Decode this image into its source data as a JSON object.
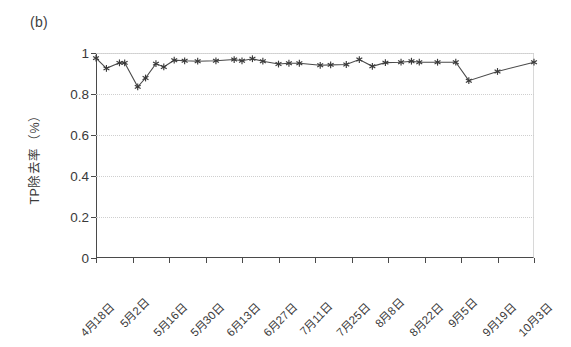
{
  "panel": {
    "label": "(b)"
  },
  "axes": {
    "ylabel": "TP除去率（%）",
    "ytick_labels": [
      "1",
      "0.8",
      "0.6",
      "0.4",
      "0.2",
      "0"
    ],
    "xtick_labels": [
      "4月18日",
      "5月2日",
      "5月16日",
      "5月30日",
      "6月13日",
      "6月27日",
      "7月11日",
      "7月25日",
      "8月8日",
      "8月22日",
      "9月5日",
      "9月19日",
      "10月3日"
    ]
  },
  "style": {
    "line_color": "#4a4a4a",
    "marker_color": "#3a3a3a",
    "grid_color": "#cfcfcf",
    "axis_color": "#4a4a4a",
    "background": "#ffffff"
  },
  "chart_data": {
    "type": "line",
    "title": "(b)",
    "xlabel": "",
    "ylabel": "TP除去率（%）",
    "ylim": [
      0,
      1
    ],
    "yticks": [
      0,
      0.2,
      0.4,
      0.6,
      0.8,
      1
    ],
    "grid": true,
    "legend": "none",
    "marker": "asterisk",
    "xtick_labels": [
      "4月18日",
      "5月2日",
      "5月16日",
      "5月30日",
      "6月13日",
      "6月27日",
      "7月11日",
      "7月25日",
      "8月8日",
      "8月22日",
      "9月5日",
      "9月19日",
      "10月3日"
    ],
    "xtick_positions": [
      0,
      14,
      28,
      42,
      56,
      70,
      84,
      98,
      112,
      126,
      140,
      154,
      168
    ],
    "xlim": [
      0,
      168
    ],
    "x_unit": "days since 4月18日",
    "series": [
      {
        "name": "TP除去率",
        "x": [
          0,
          4,
          9,
          11,
          16,
          19,
          23,
          26,
          30,
          34,
          39,
          46,
          53,
          56,
          60,
          64,
          70,
          74,
          78,
          86,
          90,
          96,
          101,
          106,
          111,
          117,
          121,
          124,
          131,
          138,
          143,
          154,
          168
        ],
        "values": [
          0.975,
          0.925,
          0.952,
          0.952,
          0.835,
          0.878,
          0.948,
          0.932,
          0.965,
          0.962,
          0.96,
          0.962,
          0.968,
          0.962,
          0.972,
          0.96,
          0.946,
          0.95,
          0.95,
          0.94,
          0.942,
          0.944,
          0.968,
          0.935,
          0.953,
          0.955,
          0.96,
          0.955,
          0.955,
          0.955,
          0.865,
          0.91,
          0.955
        ],
        "color": "#4a4a4a"
      }
    ]
  }
}
